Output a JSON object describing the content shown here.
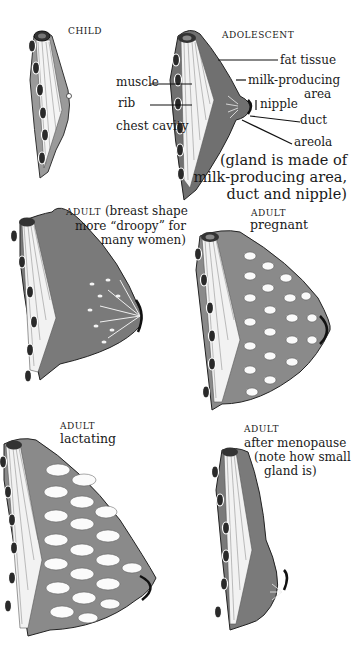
{
  "figure": {
    "panels": [
      {
        "id": "child",
        "stage": "CHILD",
        "caption": ""
      },
      {
        "id": "adolescent",
        "stage": "ADOLESCENT",
        "caption": ""
      },
      {
        "id": "adult",
        "stage": "ADULT",
        "caption_lines": [
          "(breast shape",
          "more “droopy” for",
          "many women)"
        ]
      },
      {
        "id": "pregnant",
        "stage": "ADULT",
        "caption": "pregnant"
      },
      {
        "id": "lactating",
        "stage": "ADULT",
        "caption": "lactating"
      },
      {
        "id": "menopause",
        "stage": "ADULT",
        "caption_lines": [
          "after menopause",
          "(note how small",
          "gland is)"
        ]
      }
    ],
    "labels": {
      "muscle": "muscle",
      "rib": "rib",
      "chest_cavity": "chest cavity",
      "fat_tissue": "fat tissue",
      "milk_producing": "milk-producing",
      "area": "area",
      "nipple": "nipple",
      "duct": "duct",
      "areola": "areola"
    },
    "note_lines": [
      "(gland is made of",
      "milk-producing area,",
      "duct and nipple)"
    ],
    "colors": {
      "tissue": "#7a7a7a",
      "dark": "#2a2a2a",
      "paper": "#ffffff"
    }
  }
}
